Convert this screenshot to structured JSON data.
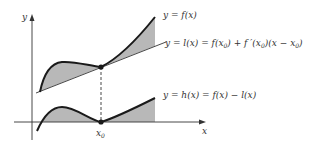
{
  "diagram": {
    "axes": {
      "y_label": "y",
      "x_label": "x",
      "x0_label": "x",
      "x0_sub": "0"
    },
    "labels": {
      "f": "y = f(x)",
      "l": "y = l(x) = f(x",
      "l_sub1": "0",
      "l_mid": ") + f ′(x",
      "l_sub2": "0",
      "l_mid2": ")(x − x",
      "l_sub3": "0",
      "l_end": ")",
      "h": "y = h(x) = f(x) − l(x)"
    },
    "colors": {
      "curve": "#1a1a1a",
      "shade": "#b8b8b8",
      "axis": "#333333",
      "tangent": "#333333"
    }
  }
}
